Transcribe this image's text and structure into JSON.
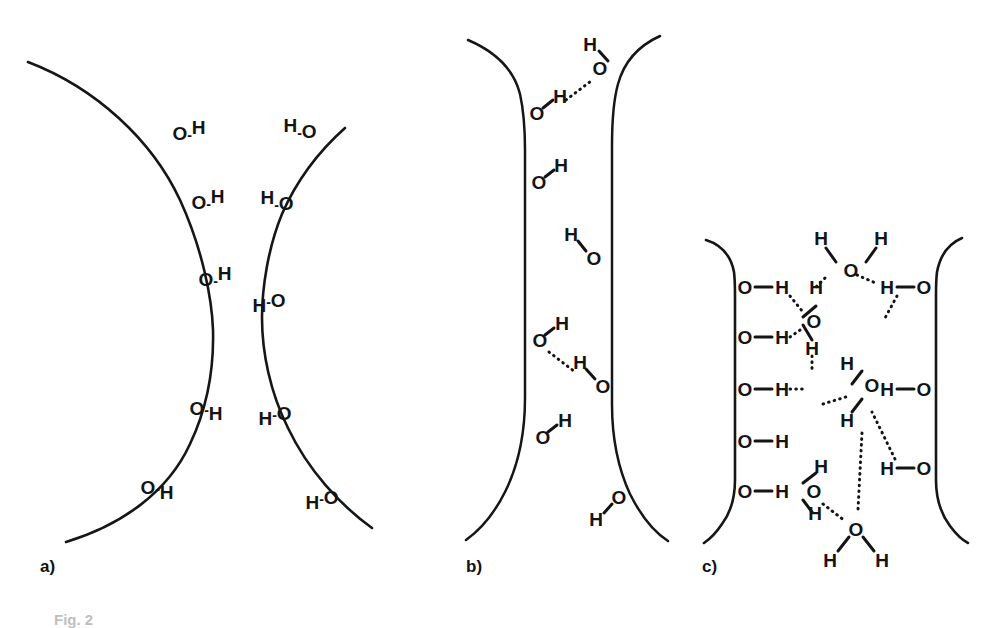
{
  "figure": {
    "caption": "Fig. 2",
    "type": "scientific-schematic",
    "background_color": "#ffffff",
    "ink_color": "#141414"
  },
  "panels": [
    {
      "id": "a",
      "label": "a)",
      "label_x": 40,
      "label_y": 567,
      "geometry": "hyperbolic hourglass pore, wide at top and bottom, narrow waist in the middle",
      "wall_left_path": "M 28 62 C 110 95 175 175 202 265 C 222 335 222 368 208 432 C 190 495 140 528 76 545",
      "wall_right_path": "M 330 300 C 300 250 276 200 262 150 C 252 115 248 95 246 76 M 246 76 C 248 95 252 115 262 150",
      "groups": [
        {
          "text": "O",
          "h": "H",
          "style": "OH-upright",
          "x": 189,
          "y": 133,
          "note": "surface hydroxyl, left wall top"
        },
        {
          "text": "O",
          "h": "H",
          "style": "OH-upright",
          "x": 206,
          "y": 202,
          "note": "surface hydroxyl, left wall"
        },
        {
          "text": "O",
          "h": "H",
          "style": "OH-upright",
          "x": 213,
          "y": 279,
          "note": "surface hydroxyl, left wall waist"
        },
        {
          "text": "O",
          "h": "H",
          "style": "OH-downright",
          "x": 204,
          "y": 409,
          "note": "surface hydroxyl, left wall lower"
        },
        {
          "text": "O",
          "h": "H",
          "style": "OH-downright",
          "x": 155,
          "y": 487,
          "note": "surface hydroxyl, left wall bottom"
        },
        {
          "text": "H",
          "h": "O",
          "style": "HO-upright",
          "x": 299,
          "y": 131,
          "note": "surface hydroxyl, right wall top"
        },
        {
          "text": "H",
          "h": "O",
          "style": "HO-upright",
          "x": 276,
          "y": 203,
          "note": "surface hydroxyl, right wall"
        },
        {
          "text": "H",
          "h": "O",
          "style": "HO-upright",
          "x": 268,
          "y": 300,
          "note": "surface hydroxyl, right wall waist"
        },
        {
          "text": "H",
          "h": "O",
          "style": "HO-upright",
          "x": 273,
          "y": 413,
          "note": "surface hydroxyl, right wall lower"
        },
        {
          "text": "H",
          "h": "O",
          "style": "HO-upright",
          "x": 321,
          "y": 497,
          "note": "surface hydroxyl, right wall bottom"
        }
      ]
    },
    {
      "id": "b",
      "label": "b)",
      "label_x": 466,
      "label_y": 567,
      "geometry": "narrow slit pore with nearly parallel vertical walls, flaring at top and bottom",
      "groups": [
        {
          "text": "O",
          "h": "H",
          "style": "OH-upright",
          "x": 536,
          "y": 112,
          "note": "left wall hydroxyl, hydrogen bonded"
        },
        {
          "text": "H",
          "h": "O",
          "style": "HO-stack",
          "x": 599,
          "y": 58,
          "note": "water molecule bridging the slit"
        },
        {
          "text": "O",
          "h": "H",
          "style": "OH-upright",
          "x": 537,
          "y": 182,
          "note": "left wall hydroxyl"
        },
        {
          "text": "H",
          "h": "O",
          "style": "HO-stack",
          "x": 577,
          "y": 248,
          "note": "water molecule near right wall"
        },
        {
          "text": "O",
          "h": "H",
          "style": "OH-upright",
          "x": 538,
          "y": 340,
          "note": "left wall hydroxyl, hydrogen bonded"
        },
        {
          "text": "H",
          "h": "O",
          "style": "HO-stack",
          "x": 586,
          "y": 376,
          "note": "water molecule hydrogen bonded to left wall"
        },
        {
          "text": "O",
          "h": "H",
          "style": "OH-upright",
          "x": 541,
          "y": 437,
          "note": "left wall hydroxyl"
        },
        {
          "text": "H",
          "h": "O",
          "style": "HO-upright",
          "x": 602,
          "y": 512,
          "note": "right wall hydroxyl lower"
        }
      ],
      "hydrogen_bonds": 2
    },
    {
      "id": "c",
      "label": "c)",
      "label_x": 702,
      "label_y": 567,
      "geometry": "wide slit pore with straight vertical walls, filled with a hydrogen bonded water network",
      "wall_hydroxyls_left": [
        "O-H",
        "O-H",
        "O-H",
        "O-H",
        "O-H"
      ],
      "wall_hydroxyls_right": [
        "H-O",
        "H-O",
        "H-O"
      ],
      "water_molecules": 5,
      "hydrogen_bonds": 11
    }
  ],
  "chemistry": {
    "oxygen_symbol": "O",
    "hydrogen_symbol": "H",
    "covalent_bond": "solid line",
    "hydrogen_bond": "dotted line"
  }
}
